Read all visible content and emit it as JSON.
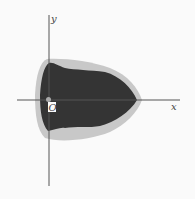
{
  "figure": {
    "axes": {
      "x_label": "x",
      "y_label": "y",
      "origin_label": "O"
    },
    "colors": {
      "background": "#fafafa",
      "region_outer": "#c8c8c8",
      "region_inner": "#343434",
      "axis": "#555555"
    },
    "regions": [
      {
        "name": "outer-halo",
        "fill": "light-gray"
      },
      {
        "name": "inner-region",
        "fill": "dark-gray"
      }
    ]
  }
}
